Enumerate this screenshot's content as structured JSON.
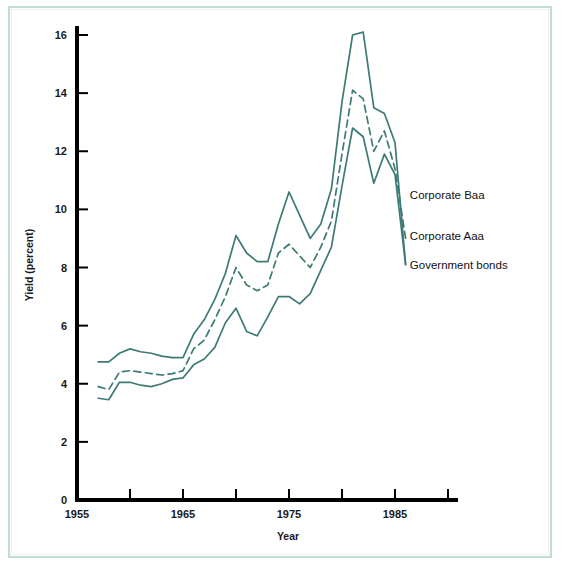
{
  "chart_data": {
    "type": "line",
    "title": "",
    "xlabel": "Year",
    "ylabel": "Yield (percent)",
    "xlim": [
      1955,
      1990
    ],
    "ylim": [
      0,
      16.6
    ],
    "xticks": [
      1955,
      1960,
      1965,
      1970,
      1975,
      1980,
      1985,
      1990
    ],
    "xtick_labels": [
      "1955",
      "",
      "1965",
      "",
      "1975",
      "",
      "1985",
      ""
    ],
    "xtick_labels_shown": [
      "1955",
      "1965",
      "1975",
      "1985"
    ],
    "yticks": [
      0,
      2,
      4,
      6,
      8,
      10,
      12,
      14,
      16
    ],
    "ytick_labels": [
      "0",
      "2",
      "4",
      "6",
      "8",
      "10",
      "12",
      "14",
      "16"
    ],
    "grid": false,
    "legend_position": "right-inline-end-of-line",
    "x": [
      1957,
      1958,
      1959,
      1960,
      1961,
      1962,
      1963,
      1964,
      1965,
      1966,
      1967,
      1968,
      1969,
      1970,
      1971,
      1972,
      1973,
      1974,
      1975,
      1976,
      1977,
      1978,
      1979,
      1980,
      1981,
      1982,
      1983,
      1984,
      1985,
      1986
    ],
    "series": [
      {
        "name": "Corporate Baa",
        "style": "solid",
        "color": "#3e7a76",
        "values": [
          4.75,
          4.75,
          5.05,
          5.2,
          5.1,
          5.05,
          4.95,
          4.9,
          4.9,
          5.7,
          6.2,
          6.9,
          7.8,
          9.1,
          8.5,
          8.2,
          8.2,
          9.5,
          10.6,
          9.8,
          9.0,
          9.5,
          10.7,
          13.7,
          16.0,
          16.1,
          13.5,
          13.3,
          12.3,
          8.1
        ]
      },
      {
        "name": "Corporate Aaa",
        "style": "dashed",
        "color": "#3e7a76",
        "values": [
          3.9,
          3.8,
          4.4,
          4.45,
          4.4,
          4.35,
          4.3,
          4.35,
          4.45,
          5.2,
          5.5,
          6.2,
          7.0,
          8.0,
          7.4,
          7.2,
          7.4,
          8.5,
          8.8,
          8.4,
          8.0,
          8.7,
          9.6,
          11.9,
          14.1,
          13.8,
          12.0,
          12.7,
          11.4,
          9.0
        ]
      },
      {
        "name": "Government bonds",
        "style": "solid",
        "color": "#3e7a76",
        "values": [
          3.5,
          3.45,
          4.05,
          4.05,
          3.95,
          3.9,
          4.0,
          4.15,
          4.2,
          4.65,
          4.85,
          5.25,
          6.1,
          6.6,
          5.8,
          5.65,
          6.3,
          7.0,
          7.0,
          6.75,
          7.1,
          7.9,
          8.7,
          10.8,
          12.8,
          12.5,
          10.9,
          11.9,
          11.2,
          8.1
        ]
      }
    ],
    "annotations": [
      {
        "text": "Corporate Baa",
        "series": "Corporate Baa",
        "x": 1986.4,
        "y": 10.5
      },
      {
        "text": "Corporate Aaa",
        "series": "Corporate Aaa",
        "x": 1986.4,
        "y": 9.1
      },
      {
        "text": "Government bonds",
        "series": "Government bonds",
        "x": 1986.4,
        "y": 8.1
      }
    ],
    "colors": {
      "line": "#3e7a76",
      "axis": "#000000",
      "frame": "#c3dcd9",
      "background": "#ffffff",
      "text": "#1a1a1a"
    }
  }
}
